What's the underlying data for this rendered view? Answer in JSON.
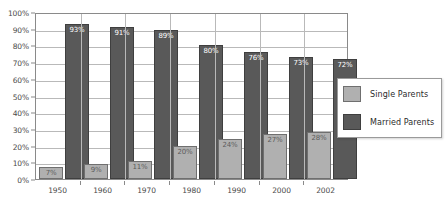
{
  "chart_data": {
    "type": "bar",
    "title": "",
    "xlabel": "",
    "ylabel": "",
    "ylim": [
      0,
      100
    ],
    "grid": true,
    "legend_position": "right-inside",
    "categories": [
      "1950",
      "1960",
      "1970",
      "1980",
      "1990",
      "2000",
      "2002"
    ],
    "ytick_labels": [
      "100%",
      "90%",
      "80%",
      "70%",
      "60%",
      "50%",
      "40%",
      "30%",
      "20%",
      "10%",
      "0%"
    ],
    "ytick_values": [
      100,
      90,
      80,
      70,
      60,
      50,
      40,
      30,
      20,
      10,
      0
    ],
    "series": [
      {
        "name": "Single Parents",
        "color": "#b0b0b0",
        "values": [
          7,
          9,
          11,
          20,
          24,
          27,
          28
        ],
        "data_labels": [
          "7%",
          "9%",
          "11%",
          "20%",
          "24%",
          "27%",
          "28%"
        ]
      },
      {
        "name": "Married Parents",
        "color": "#595959",
        "values": [
          93,
          91,
          89,
          80,
          76,
          73,
          72
        ],
        "data_labels": [
          "93%",
          "91%",
          "89%",
          "80%",
          "76%",
          "73%",
          "72%"
        ]
      }
    ]
  },
  "legend": {
    "items": [
      {
        "label": "Single Parents",
        "color": "#b0b0b0"
      },
      {
        "label": "Married Parents",
        "color": "#595959"
      }
    ]
  },
  "colors": {
    "single_parents": "#b0b0b0",
    "married_parents": "#595959",
    "gridline": "#b9b9b9",
    "frame": "#8a8a8a",
    "axis_text": "#4a4a4a",
    "background": "#ffffff"
  }
}
